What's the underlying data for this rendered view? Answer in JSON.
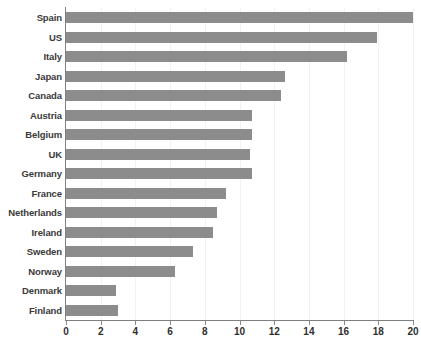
{
  "chart_data": {
    "type": "bar",
    "orientation": "horizontal",
    "title": "",
    "subtitle": "",
    "xlabel": "",
    "ylabel": "",
    "xlim": [
      0,
      20
    ],
    "ylim": null,
    "grid": "vertical-only",
    "legend": null,
    "bar_color": "#8c8c8c",
    "axis_color": "#7f7f7f",
    "gridline_color": "#f2f2f2",
    "xticks": [
      0,
      2,
      4,
      6,
      8,
      10,
      12,
      14,
      16,
      18,
      20
    ],
    "xtick_labels": [
      "0",
      "2",
      "4",
      "6",
      "8",
      "10",
      "12",
      "14",
      "16",
      "18",
      "20"
    ],
    "categories": [
      "Spain",
      "US",
      "Italy",
      "Japan",
      "Canada",
      "Austria",
      "Belgium",
      "UK",
      "Germany",
      "France",
      "Netherlands",
      "Ireland",
      "Sweden",
      "Norway",
      "Denmark",
      "Finland"
    ],
    "values": [
      20.0,
      17.9,
      16.2,
      12.6,
      12.4,
      10.7,
      10.7,
      10.6,
      10.7,
      9.2,
      8.7,
      8.5,
      7.3,
      6.3,
      2.9,
      3.0
    ]
  }
}
